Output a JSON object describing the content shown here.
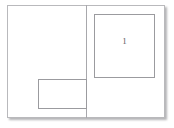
{
  "diagram": {
    "canvas": {
      "width": 174,
      "height": 128,
      "background_color": "#ffffff"
    },
    "page_sheet": {
      "name": "page-sheet",
      "border_color": "#b9b9bc",
      "fill_color": "#ffffff",
      "shadow_color": "#3c3c41"
    },
    "gutter": {
      "name": "vertical-divider",
      "color": "#a8a8ac",
      "orientation": "vertical"
    },
    "regions": [
      {
        "id": "region-1",
        "label": "1",
        "position": "upper-right",
        "border_color": "#9b9b9f",
        "fill": "none"
      },
      {
        "id": "region-2",
        "label": "",
        "position": "lower-left",
        "border_color": "#9b9b9f",
        "fill": "none"
      }
    ]
  }
}
